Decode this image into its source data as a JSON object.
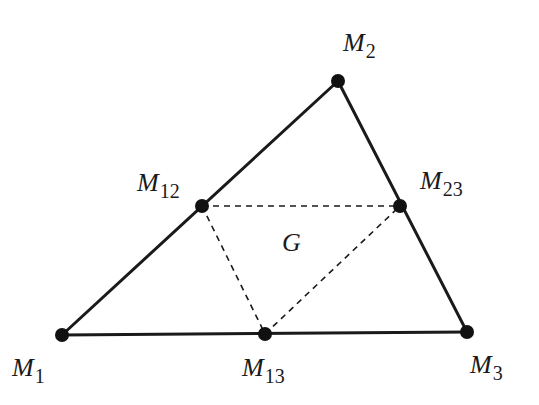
{
  "diagram": {
    "colors": {
      "background": "#ffffff",
      "stroke": "#1a1a1a",
      "point": "#111111"
    },
    "points": [
      {
        "id": "M1",
        "base": "M",
        "sub": "1",
        "x": 62,
        "y": 335,
        "label_x": 12,
        "label_y": 355
      },
      {
        "id": "M2",
        "base": "M",
        "sub": "2",
        "x": 338,
        "y": 81,
        "label_x": 343,
        "label_y": 30
      },
      {
        "id": "M3",
        "base": "M",
        "sub": "3",
        "x": 467,
        "y": 332,
        "label_x": 470,
        "label_y": 352
      },
      {
        "id": "M12",
        "base": "M",
        "sub": "12",
        "x": 202,
        "y": 206,
        "label_x": 137,
        "label_y": 170
      },
      {
        "id": "M23",
        "base": "M",
        "sub": "23",
        "x": 400,
        "y": 206,
        "label_x": 420,
        "label_y": 168
      },
      {
        "id": "M13",
        "base": "M",
        "sub": "13",
        "x": 265,
        "y": 334,
        "label_x": 242,
        "label_y": 355
      }
    ],
    "centroid_label": {
      "text": "G",
      "x": 282,
      "y": 230
    },
    "solid_edges": [
      [
        "M1",
        "M2"
      ],
      [
        "M2",
        "M3"
      ],
      [
        "M1",
        "M3"
      ]
    ],
    "dashed_edges": [
      [
        "M12",
        "M23"
      ],
      [
        "M12",
        "M13"
      ],
      [
        "M13",
        "M23"
      ]
    ]
  }
}
